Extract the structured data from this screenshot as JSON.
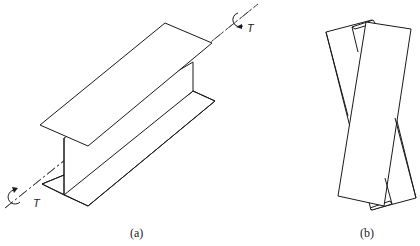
{
  "figure_a": {
    "caption": "(a)",
    "torque_label_top": "T",
    "torque_label_bottom": "T"
  },
  "figure_b": {
    "caption": "(b)"
  }
}
